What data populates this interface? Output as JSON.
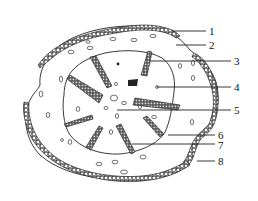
{
  "diagram": {
    "type": "botanical cross-section (stem)",
    "labels": [
      {
        "id": 1,
        "text": "1",
        "x": 210,
        "y": 35,
        "line_from": [
          172,
          30
        ],
        "line_to": [
          206,
          31
        ]
      },
      {
        "id": 2,
        "text": "2",
        "x": 210,
        "y": 49,
        "line_from": [
          176,
          45
        ],
        "line_to": [
          206,
          45
        ]
      },
      {
        "id": 3,
        "text": "3",
        "x": 235,
        "y": 65,
        "line_from": [
          150,
          61
        ],
        "line_to": [
          231,
          61
        ]
      },
      {
        "id": 4,
        "text": "4",
        "x": 235,
        "y": 91,
        "line_from": [
          157,
          87
        ],
        "line_to": [
          231,
          87
        ]
      },
      {
        "id": 5,
        "text": "5",
        "x": 235,
        "y": 114,
        "line_from": [
          117,
          110
        ],
        "line_to": [
          231,
          110
        ]
      },
      {
        "id": 6,
        "text": "6",
        "x": 219,
        "y": 140,
        "line_from": [
          168,
          135
        ],
        "line_to": [
          215,
          135
        ]
      },
      {
        "id": 7,
        "text": "7",
        "x": 219,
        "y": 149,
        "line_from": [
          132,
          144
        ],
        "line_to": [
          215,
          144
        ]
      },
      {
        "id": 8,
        "text": "8",
        "x": 219,
        "y": 165,
        "line_from": [
          197,
          161
        ],
        "line_to": [
          215,
          161
        ]
      }
    ],
    "colors": {
      "ink": "#222222",
      "background": "#ffffff"
    }
  }
}
